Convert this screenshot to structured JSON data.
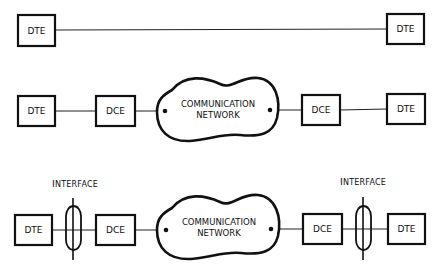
{
  "diagram": {
    "type": "network-topology",
    "rows": [
      {
        "id": "direct",
        "nodes": [
          {
            "id": "dte-left",
            "kind": "DTE",
            "label": "DTE"
          },
          {
            "id": "dte-right",
            "kind": "DTE",
            "label": "DTE"
          }
        ],
        "edges": [
          [
            "dte-left",
            "dte-right"
          ]
        ]
      },
      {
        "id": "via-network",
        "nodes": [
          {
            "id": "dte-left",
            "kind": "DTE",
            "label": "DTE"
          },
          {
            "id": "dce-left",
            "kind": "DCE",
            "label": "DCE"
          },
          {
            "id": "network",
            "kind": "cloud",
            "label_line1": "COMMUNICATION",
            "label_line2": "NETWORK"
          },
          {
            "id": "dce-right",
            "kind": "DCE",
            "label": "DCE"
          },
          {
            "id": "dte-right",
            "kind": "DTE",
            "label": "DTE"
          }
        ],
        "edges": [
          [
            "dte-left",
            "dce-left"
          ],
          [
            "dce-left",
            "network"
          ],
          [
            "network",
            "dce-right"
          ],
          [
            "dce-right",
            "dte-right"
          ]
        ]
      },
      {
        "id": "via-network-with-interfaces",
        "nodes": [
          {
            "id": "dte-left",
            "kind": "DTE",
            "label": "DTE"
          },
          {
            "id": "iface-left",
            "kind": "interface",
            "label": "INTERFACE"
          },
          {
            "id": "dce-left",
            "kind": "DCE",
            "label": "DCE"
          },
          {
            "id": "network",
            "kind": "cloud",
            "label_line1": "COMMUNICATION",
            "label_line2": "NETWORK"
          },
          {
            "id": "dce-right",
            "kind": "DCE",
            "label": "DCE"
          },
          {
            "id": "iface-right",
            "kind": "interface",
            "label": "INTERFACE"
          },
          {
            "id": "dte-right",
            "kind": "DTE",
            "label": "DTE"
          }
        ],
        "edges": [
          [
            "dte-left",
            "dce-left"
          ],
          [
            "dce-left",
            "network"
          ],
          [
            "network",
            "dce-right"
          ],
          [
            "dce-right",
            "dte-right"
          ]
        ]
      }
    ]
  },
  "labels": {
    "dte": "DTE",
    "dce": "DCE",
    "network_line1": "COMMUNICATION",
    "network_line2": "NETWORK",
    "interface_cap": "I",
    "interface_rest": "NTERFACE"
  }
}
